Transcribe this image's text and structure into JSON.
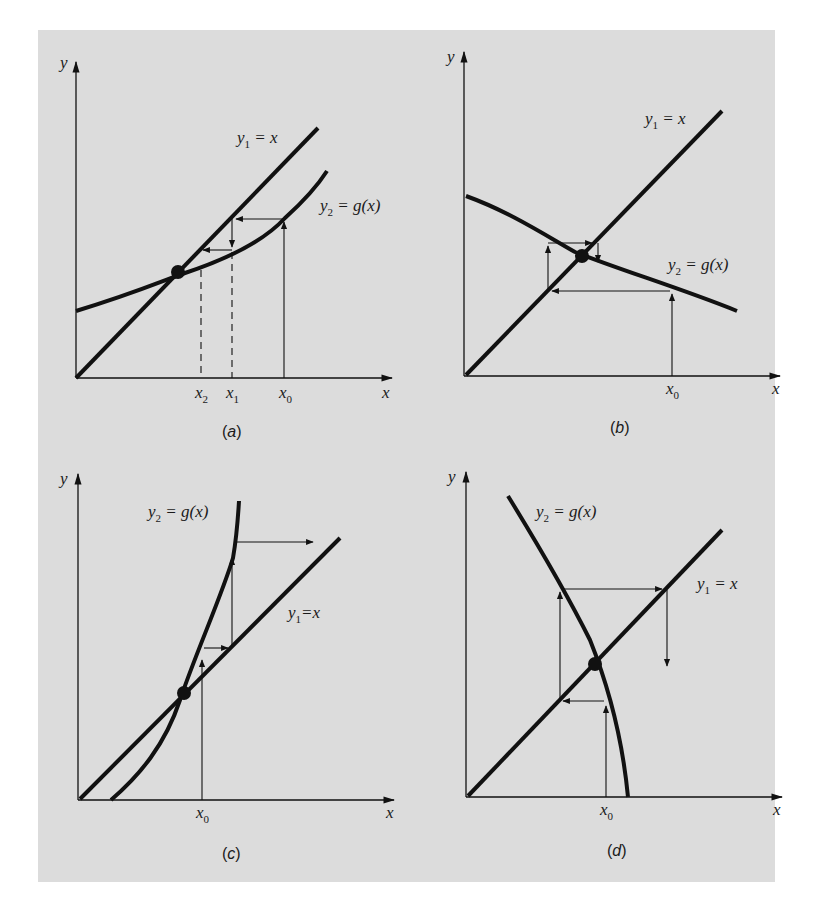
{
  "figure": {
    "background_color": "#dcdcdc",
    "line_color": "#111111",
    "panels": [
      {
        "id": "a",
        "caption": "a",
        "axis_x": "x",
        "axis_y": "y",
        "line_label": {
          "base": "y",
          "sub": "1",
          "rest": " = x"
        },
        "curve_label": {
          "base": "y",
          "sub": "2",
          "rest": " = g(x)"
        },
        "ticks": [
          {
            "base": "x",
            "sub": "2"
          },
          {
            "base": "x",
            "sub": "1"
          },
          {
            "base": "x",
            "sub": "0"
          }
        ],
        "behavior": "monotone convergence"
      },
      {
        "id": "b",
        "caption": "b",
        "axis_x": "x",
        "axis_y": "y",
        "line_label": {
          "base": "y",
          "sub": "1",
          "rest": " = x"
        },
        "curve_label": {
          "base": "y",
          "sub": "2",
          "rest": " = g(x)"
        },
        "ticks": [
          {
            "base": "x",
            "sub": "0"
          }
        ],
        "behavior": "oscillating convergence"
      },
      {
        "id": "c",
        "caption": "c",
        "axis_x": "x",
        "axis_y": "y",
        "line_label": {
          "base": "y",
          "sub": "1",
          "rest": "=x"
        },
        "curve_label": {
          "base": "y",
          "sub": "2",
          "rest": " = g(x)"
        },
        "ticks": [
          {
            "base": "x",
            "sub": "0"
          }
        ],
        "behavior": "monotone divergence"
      },
      {
        "id": "d",
        "caption": "d",
        "axis_x": "x",
        "axis_y": "y",
        "line_label": {
          "base": "y",
          "sub": "1",
          "rest": " = x"
        },
        "curve_label": {
          "base": "y",
          "sub": "2",
          "rest": " = g(x)"
        },
        "ticks": [
          {
            "base": "x",
            "sub": "0"
          }
        ],
        "behavior": "oscillating divergence"
      }
    ]
  }
}
